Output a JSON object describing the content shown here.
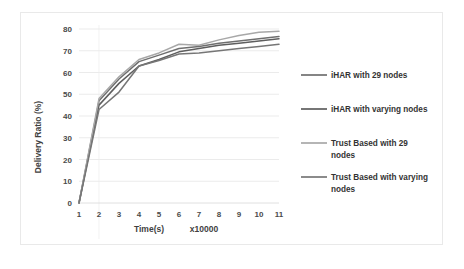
{
  "chart_data": {
    "type": "line",
    "title": "",
    "xlabel": "Time(s)",
    "xlabel_suffix": "x10000",
    "ylabel": "Delivery Ratio (%)",
    "x": [
      1,
      2,
      3,
      4,
      5,
      6,
      7,
      8,
      9,
      10,
      11
    ],
    "xlim": [
      1,
      11
    ],
    "ylim": [
      0,
      80
    ],
    "xticks": [
      "1",
      "2",
      "3",
      "4",
      "5",
      "6",
      "7",
      "8",
      "9",
      "10",
      "11"
    ],
    "yticks": [
      "0",
      "10",
      "20",
      "30",
      "40",
      "50",
      "60",
      "70",
      "80"
    ],
    "grid": "horizontal",
    "legend_position": "right",
    "series": [
      {
        "name": "iHAR with 29 nodes",
        "color": "#6f6f6f",
        "values": [
          0,
          47,
          57,
          65,
          68,
          71,
          72,
          73.5,
          74.5,
          75.5,
          76.5
        ]
      },
      {
        "name": "iHAR with varying nodes",
        "color": "#5e5e5e",
        "values": [
          0,
          45,
          55,
          63,
          66,
          69.5,
          71,
          72.5,
          73.5,
          74.5,
          75.5
        ]
      },
      {
        "name": "Trust Based with 29 nodes",
        "color": "#a8a8a8",
        "values": [
          0,
          48,
          58,
          66,
          69,
          73,
          72.5,
          75,
          77,
          78.5,
          79
        ]
      },
      {
        "name": "Trust Based with varying nodes",
        "color": "#767676",
        "values": [
          0,
          43,
          51,
          63,
          65.5,
          68.5,
          69,
          70,
          71,
          72,
          73
        ]
      }
    ]
  },
  "legend": {
    "entries": [
      {
        "label": "iHAR with 29 nodes",
        "color": "#6f6f6f"
      },
      {
        "label": "iHAR with varying nodes",
        "color": "#5e5e5e"
      },
      {
        "label_line1": "Trust Based with 29",
        "label_line2": "nodes",
        "color": "#a8a8a8"
      },
      {
        "label_line1": "Trust Based with varying",
        "label_line2": "nodes",
        "color": "#767676"
      }
    ]
  }
}
